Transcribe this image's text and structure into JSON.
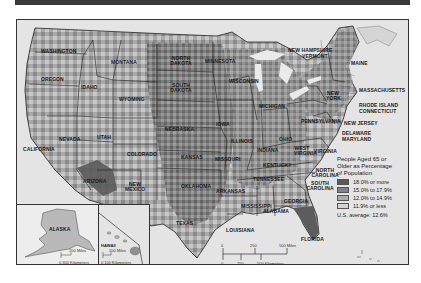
{
  "map": {
    "title": "People Aged 65 or Older as Percentage of Population",
    "legend": {
      "title_lines": [
        "People Aged 65 or",
        "Older as Percentage",
        "of Population"
      ],
      "items": [
        {
          "label": "18.0% or more",
          "color": "#5a5a5a"
        },
        {
          "label": "15.0% to 17.9%",
          "color": "#838383"
        },
        {
          "label": "12.0% to 14.9%",
          "color": "#adadad"
        },
        {
          "label": "11.9% or less",
          "color": "#d3d3d3"
        }
      ],
      "average": "U.S. average: 12.6%"
    },
    "state_labels": [
      {
        "name": "WASHINGTON",
        "x": 40,
        "y": 28
      },
      {
        "name": "OREGON",
        "x": 40,
        "y": 58
      },
      {
        "name": "IDAHO",
        "x": 80,
        "y": 66
      },
      {
        "name": "MONTANA",
        "x": 110,
        "y": 41
      },
      {
        "name": "WYOMING",
        "x": 118,
        "y": 78
      },
      {
        "name": "NORTH DAKOTA",
        "x": 166,
        "y": 37
      },
      {
        "name": "SOUTH DAKOTA",
        "x": 166,
        "y": 64
      },
      {
        "name": "MINNESOTA",
        "x": 204,
        "y": 40
      },
      {
        "name": "WISCONSIN",
        "x": 228,
        "y": 60
      },
      {
        "name": "MICHIGAN",
        "x": 258,
        "y": 85
      },
      {
        "name": "NEVADA",
        "x": 58,
        "y": 118
      },
      {
        "name": "CALIFORNIA",
        "x": 24,
        "y": 128
      },
      {
        "name": "UTAH",
        "x": 96,
        "y": 116
      },
      {
        "name": "COLORADO",
        "x": 126,
        "y": 133
      },
      {
        "name": "NEBRASKA",
        "x": 164,
        "y": 108
      },
      {
        "name": "IOWA",
        "x": 215,
        "y": 103
      },
      {
        "name": "ILLINOIS",
        "x": 230,
        "y": 120
      },
      {
        "name": "INDIANA",
        "x": 250,
        "y": 120
      },
      {
        "name": "OHIO",
        "x": 278,
        "y": 118
      },
      {
        "name": "PENNSYLVANIA",
        "x": 300,
        "y": 100
      },
      {
        "name": "NEW YORK",
        "x": 325,
        "y": 72
      },
      {
        "name": "KANSAS",
        "x": 180,
        "y": 136
      },
      {
        "name": "MISSOURI",
        "x": 214,
        "y": 138
      },
      {
        "name": "KENTUCKY",
        "x": 262,
        "y": 144
      },
      {
        "name": "WEST VIRGINIA",
        "x": 293,
        "y": 128
      },
      {
        "name": "VIRGINIA",
        "x": 313,
        "y": 130
      },
      {
        "name": "TENNESSEE",
        "x": 252,
        "y": 158
      },
      {
        "name": "NORTH CAROLINA",
        "x": 310,
        "y": 150
      },
      {
        "name": "SOUTH CAROLINA",
        "x": 305,
        "y": 163
      },
      {
        "name": "OKLAHOMA",
        "x": 180,
        "y": 165
      },
      {
        "name": "ARKANSAS",
        "x": 215,
        "y": 170
      },
      {
        "name": "MISSISSIPPI",
        "x": 240,
        "y": 185
      },
      {
        "name": "ALABAMA",
        "x": 262,
        "y": 190
      },
      {
        "name": "GEORGIA",
        "x": 283,
        "y": 180
      },
      {
        "name": "ARIZONA",
        "x": 82,
        "y": 160
      },
      {
        "name": "NEW MEXICO",
        "x": 124,
        "y": 166
      },
      {
        "name": "TEXAS",
        "x": 175,
        "y": 202
      },
      {
        "name": "LOUISIANA",
        "x": 225,
        "y": 209
      },
      {
        "name": "FLORIDA",
        "x": 300,
        "y": 218
      },
      {
        "name": "MAINE",
        "x": 350,
        "y": 42
      }
    ],
    "callout_labels": [
      {
        "name": "NEW HAMPSHIRE",
        "x": 287,
        "y": 29
      },
      {
        "name": "VERMONT",
        "x": 301,
        "y": 35
      },
      {
        "name": "MASSACHUSETTS",
        "x": 358,
        "y": 69
      },
      {
        "name": "RHODE ISLAND",
        "x": 358,
        "y": 84
      },
      {
        "name": "CONNECTICUT",
        "x": 358,
        "y": 90
      },
      {
        "name": "NEW JERSEY",
        "x": 343,
        "y": 102
      },
      {
        "name": "DELAWARE",
        "x": 341,
        "y": 112
      },
      {
        "name": "MARYLAND",
        "x": 341,
        "y": 118
      }
    ],
    "insets": {
      "alaska": {
        "label": "ALASKA",
        "scale_miles": "200 Miles",
        "scale_km": "0 300 Kilometers"
      },
      "hawaii": {
        "label": "HAWAII",
        "scale_miles": "100 Miles",
        "scale_km": "0 100 Kilometers"
      }
    },
    "scale_bar": {
      "miles_ticks": [
        "0",
        "250",
        "500 Miles"
      ],
      "km_ticks": [
        "0",
        "250",
        "500 Kilometers"
      ]
    }
  }
}
